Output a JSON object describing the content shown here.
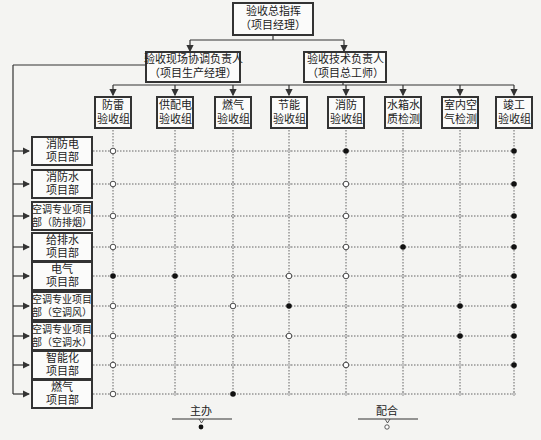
{
  "title": {
    "line1": "验收总指挥",
    "line2": "（项目经理）"
  },
  "coordinator": {
    "line1": "验收现场协调负责人",
    "line2": "（项目生产经理）"
  },
  "technical": {
    "line1": "验收技术负责人",
    "line2": "（项目总工师）"
  },
  "groups": [
    {
      "line1": "防雷",
      "line2": "验收组",
      "x": 113
    },
    {
      "line1": "供配电",
      "line2": "验收组",
      "x": 175
    },
    {
      "line1": "燃气",
      "line2": "验收组",
      "x": 233
    },
    {
      "line1": "节能",
      "line2": "验收组",
      "x": 289
    },
    {
      "line1": "消防",
      "line2": "验收组",
      "x": 346
    },
    {
      "line1": "水箱水",
      "line2": "质检测",
      "x": 403
    },
    {
      "line1": "室内空",
      "line2": "气检测",
      "x": 460
    },
    {
      "line1": "竣工",
      "line2": "验收组",
      "x": 514
    }
  ],
  "departments": [
    {
      "line1": "消防电",
      "line2": "项目部",
      "y": 151,
      "marks": "OtttFttF"
    },
    {
      "line1": "消防水",
      "line2": "项目部",
      "y": 184,
      "marks": "OtttOttF"
    },
    {
      "line1": "空调专业项目",
      "line2": "部（防排烟）",
      "y": 216,
      "marks": "OtttOttF"
    },
    {
      "line1": "给排水",
      "line2": "项目部",
      "y": 247,
      "marks": "OtttOFtF"
    },
    {
      "line1": "电气",
      "line2": "项目部",
      "y": 276,
      "marks": "FFtOOttF"
    },
    {
      "line1": "空调专业项目",
      "line2": "部（空调风）",
      "y": 306,
      "marks": "OtOFttFF"
    },
    {
      "line1": "空调专业项目",
      "line2": "部（空调水）",
      "y": 336,
      "marks": "OttOttF F"
    },
    {
      "line1": "智能化",
      "line2": "项目部",
      "y": 365,
      "marks": "OtttOttF"
    },
    {
      "line1": "燃气",
      "line2": "项目部",
      "y": 394,
      "marks": "OtFtttttO"
    }
  ],
  "legend": {
    "primary": "主办",
    "support": "配合"
  },
  "colors": {
    "line": "#333333",
    "grid": "#555555",
    "background": "#f4f4f2"
  }
}
